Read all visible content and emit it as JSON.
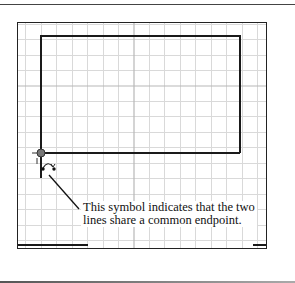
{
  "figure": {
    "caption_line1": "This symbol indicates that the two",
    "caption_line2": "lines share a common endpoint.",
    "symbol": "coincident-constraint-icon",
    "colors": {
      "grid_minor": "#d6d6d6",
      "grid_major": "#bdbdbd",
      "sketch_line": "#1a1a1a",
      "frame": "#222222"
    }
  }
}
